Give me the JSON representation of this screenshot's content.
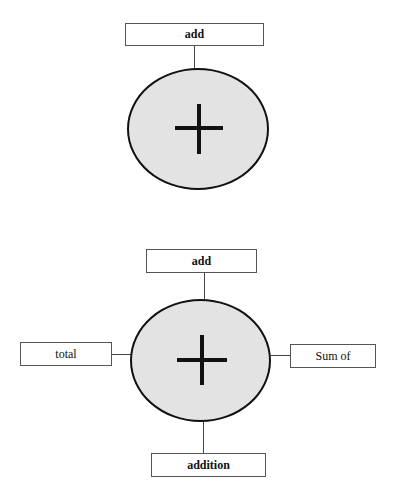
{
  "diagram1": {
    "center_symbol": "plus-icon",
    "top_label": "add"
  },
  "diagram2": {
    "center_symbol": "plus-icon",
    "top_label": "add",
    "left_label": "total",
    "right_label": "Sum of",
    "bottom_label": "addition"
  },
  "colors": {
    "ellipse_fill": "#e3e3e3",
    "stroke": "#111111"
  }
}
